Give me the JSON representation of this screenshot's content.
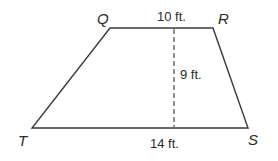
{
  "figure": {
    "shape": "trapezoid",
    "vertices": {
      "Q": {
        "label": "Q",
        "x": 110,
        "y": 28
      },
      "R": {
        "label": "R",
        "x": 213,
        "y": 28
      },
      "S": {
        "label": "S",
        "x": 248,
        "y": 128
      },
      "T": {
        "label": "T",
        "x": 32,
        "y": 128
      }
    },
    "measurements": {
      "top_base": "10 ft.",
      "height": "9 ft.",
      "bottom_base": "14 ft."
    },
    "colors": {
      "stroke": "#3a3a3a",
      "text": "#2a2a2a",
      "background": "#ffffff"
    }
  }
}
